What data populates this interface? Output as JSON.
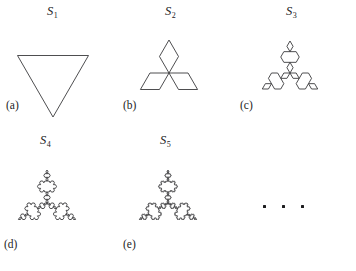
{
  "figure": {
    "width": 356,
    "height": 271,
    "background_color": "#ffffff",
    "stroke_color": "#3a3a3c",
    "text_color": "#1c1c1e"
  },
  "panels": [
    {
      "id": "s1",
      "part_label": "(a)",
      "title_text": "S",
      "title_subscript": "1",
      "iteration": 0,
      "segments": 3,
      "orientation": "point-down",
      "box": {
        "left": 0,
        "top": 0,
        "width": 115,
        "height": 130
      },
      "title_pos": {
        "left": 47,
        "top": 4
      },
      "part_label_pos": {
        "left": 6,
        "top": 99
      },
      "curve": {
        "cx": 53,
        "cy": 76,
        "radius": 41,
        "start_angle_deg": 90
      }
    },
    {
      "id": "s2",
      "part_label": "(b)",
      "title_text": "S",
      "title_subscript": "2",
      "iteration": 1,
      "segments": 12,
      "orientation": "point-up",
      "box": {
        "left": 115,
        "top": 0,
        "width": 115,
        "height": 130
      },
      "title_pos": {
        "left": 50,
        "top": 4
      },
      "part_label_pos": {
        "left": 8,
        "top": 99
      },
      "curve": {
        "cx": 54,
        "cy": 73,
        "radius": 33,
        "start_angle_deg": 90
      }
    },
    {
      "id": "s3",
      "part_label": "(c)",
      "title_text": "S",
      "title_subscript": "3",
      "iteration": 2,
      "segments": 48,
      "orientation": "point-up",
      "box": {
        "left": 230,
        "top": 0,
        "width": 126,
        "height": 130
      },
      "title_pos": {
        "left": 56,
        "top": 4
      },
      "part_label_pos": {
        "left": 10,
        "top": 99
      },
      "curve": {
        "cx": 60,
        "cy": 73,
        "radius": 32,
        "start_angle_deg": 90
      }
    },
    {
      "id": "s4",
      "part_label": "(d)",
      "title_text": "S",
      "title_subscript": "4",
      "iteration": 3,
      "segments": 192,
      "orientation": "point-up",
      "box": {
        "left": 0,
        "top": 130,
        "width": 115,
        "height": 141
      },
      "title_pos": {
        "left": 40,
        "top": 3
      },
      "part_label_pos": {
        "left": 4,
        "top": 108
      },
      "curve": {
        "cx": 47,
        "cy": 73,
        "radius": 33,
        "start_angle_deg": 90
      }
    },
    {
      "id": "s5",
      "part_label": "(e)",
      "title_text": "S",
      "title_subscript": "5",
      "iteration": 4,
      "segments": 768,
      "orientation": "point-up",
      "box": {
        "left": 115,
        "top": 130,
        "width": 115,
        "height": 141
      },
      "title_pos": {
        "left": 45,
        "top": 3
      },
      "part_label_pos": {
        "left": 8,
        "top": 108
      },
      "curve": {
        "cx": 53,
        "cy": 73,
        "radius": 33,
        "start_angle_deg": 90
      }
    }
  ],
  "ellipsis": {
    "dot_count": 3,
    "pos": {
      "left": 263,
      "top": 205
    },
    "label": "continues"
  }
}
